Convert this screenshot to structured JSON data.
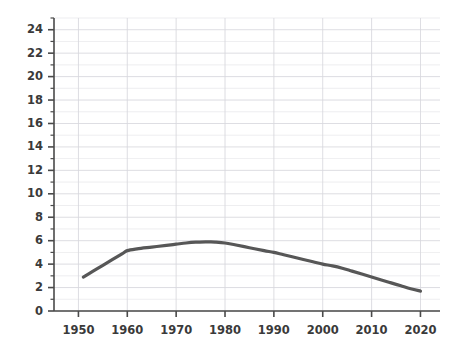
{
  "chart_data": {
    "type": "line",
    "title": "",
    "subtitle": "",
    "xlabel": "",
    "ylabel": "",
    "xlim": [
      1945,
      2024
    ],
    "ylim": [
      0,
      25
    ],
    "grid": true,
    "legend": null,
    "legend_position": "none",
    "x_major_ticks": [
      1950,
      1960,
      1970,
      1980,
      1990,
      2000,
      2010,
      2020
    ],
    "x_tick_labels": [
      "1950",
      "1960",
      "1970",
      "1980",
      "1990",
      "2000",
      "2010",
      "2020"
    ],
    "y_major_ticks": [
      0,
      2,
      4,
      6,
      8,
      10,
      12,
      14,
      16,
      18,
      20,
      22,
      24
    ],
    "y_tick_labels": [
      "0",
      "2",
      "4",
      "6",
      "8",
      "10",
      "12",
      "14",
      "16",
      "18",
      "20",
      "22",
      "24"
    ],
    "y_minor_step": 1,
    "line_color": "#575757",
    "line_width": 3.2,
    "grid_color": "#d8d8de",
    "axis_color": "#4a4a4a",
    "background_color": "#ffffff",
    "series": [
      {
        "name": "series-1",
        "x": [
          1951,
          1953,
          1955,
          1957,
          1959,
          1960,
          1962,
          1965,
          1968,
          1970,
          1972,
          1974,
          1976,
          1977,
          1978,
          1980,
          1982,
          1985,
          1988,
          1990,
          1992,
          1995,
          1998,
          2000,
          2002,
          2004,
          2006,
          2008,
          2010,
          2012,
          2014,
          2016,
          2018,
          2020
        ],
        "y": [
          2.9,
          3.4,
          3.9,
          4.4,
          4.9,
          5.15,
          5.3,
          5.45,
          5.6,
          5.7,
          5.8,
          5.87,
          5.9,
          5.9,
          5.88,
          5.8,
          5.65,
          5.4,
          5.15,
          5.0,
          4.8,
          4.5,
          4.2,
          4.0,
          3.85,
          3.65,
          3.4,
          3.15,
          2.9,
          2.65,
          2.4,
          2.15,
          1.9,
          1.7
        ]
      }
    ]
  }
}
